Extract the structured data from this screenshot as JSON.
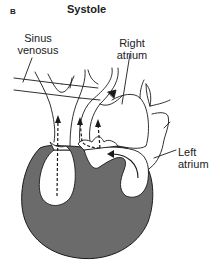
{
  "figure": {
    "panel_letter": "B",
    "title": "Systole"
  },
  "labels": {
    "sinus_venosus": [
      "Sinus",
      "venosus"
    ],
    "right_atrium": [
      "Right",
      "atrium"
    ],
    "left_atrium": [
      "Left",
      "atrium"
    ]
  },
  "colors": {
    "myocardium_fill": "#6b6b6b",
    "outline": "#1a1a1a",
    "background": "#ffffff"
  }
}
